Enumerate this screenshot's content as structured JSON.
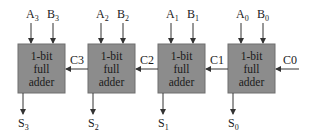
{
  "diagram": {
    "type": "4-bit ripple carry adder",
    "colors": {
      "box_fill": "#8c8c8c",
      "box_stroke": "#6e6e6e",
      "line": "#333333",
      "text": "#1a1a1a"
    },
    "adders": [
      {
        "line1": "1-bit",
        "line2": "full",
        "line3": "adder",
        "a": "A",
        "a_sub": "3",
        "b": "B",
        "b_sub": "3",
        "s": "S",
        "s_sub": "3"
      },
      {
        "line1": "1-bit",
        "line2": "full",
        "line3": "adder",
        "a": "A",
        "a_sub": "2",
        "b": "B",
        "b_sub": "2",
        "s": "S",
        "s_sub": "2"
      },
      {
        "line1": "1-bit",
        "line2": "full",
        "line3": "adder",
        "a": "A",
        "a_sub": "1",
        "b": "B",
        "b_sub": "1",
        "s": "S",
        "s_sub": "1"
      },
      {
        "line1": "1-bit",
        "line2": "full",
        "line3": "adder",
        "a": "A",
        "a_sub": "0",
        "b": "B",
        "b_sub": "0",
        "s": "S",
        "s_sub": "0"
      }
    ],
    "carries": [
      {
        "label": "C3"
      },
      {
        "label": "C2"
      },
      {
        "label": "C1"
      },
      {
        "label": "C0"
      }
    ]
  }
}
